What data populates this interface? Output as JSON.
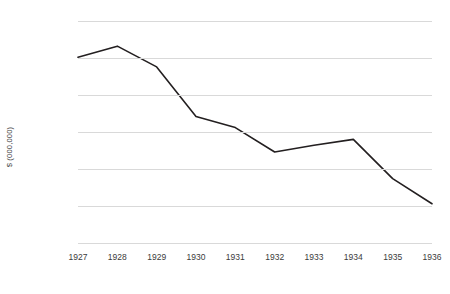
{
  "chart_data": {
    "type": "line",
    "title": "",
    "xlabel": "",
    "ylabel": "$ (000,000)",
    "categories": [
      "1927",
      "1928",
      "1929",
      "1930",
      "1931",
      "1932",
      "1933",
      "1934",
      "1935",
      "1936"
    ],
    "values": [
      45.1,
      46.6,
      43.8,
      37.1,
      35.6,
      32.3,
      33.2,
      34.0,
      28.7,
      25.3
    ],
    "series": [
      {
        "name": "",
        "values": [
          45.1,
          46.6,
          43.8,
          37.1,
          35.6,
          32.3,
          33.2,
          34.0,
          28.7,
          25.3
        ]
      }
    ],
    "ylim": [
      20,
      50
    ],
    "yticks": [
      50,
      45,
      40,
      35,
      30,
      25,
      20
    ],
    "ytick_labels": [
      "50",
      "45",
      "40",
      "35",
      "30",
      "25",
      "20"
    ],
    "xtick_labels": [
      "1927",
      "1928",
      "1929",
      "1930",
      "1931",
      "1932",
      "1933",
      "1934",
      "1935",
      "1936"
    ],
    "grid": "horizontal",
    "legend": "none",
    "line_color": "#231f20",
    "grid_color": "#d9d9d9",
    "text_color": "#3b3b3b",
    "background_color": "#ffffff",
    "markers": false,
    "annotations": []
  }
}
